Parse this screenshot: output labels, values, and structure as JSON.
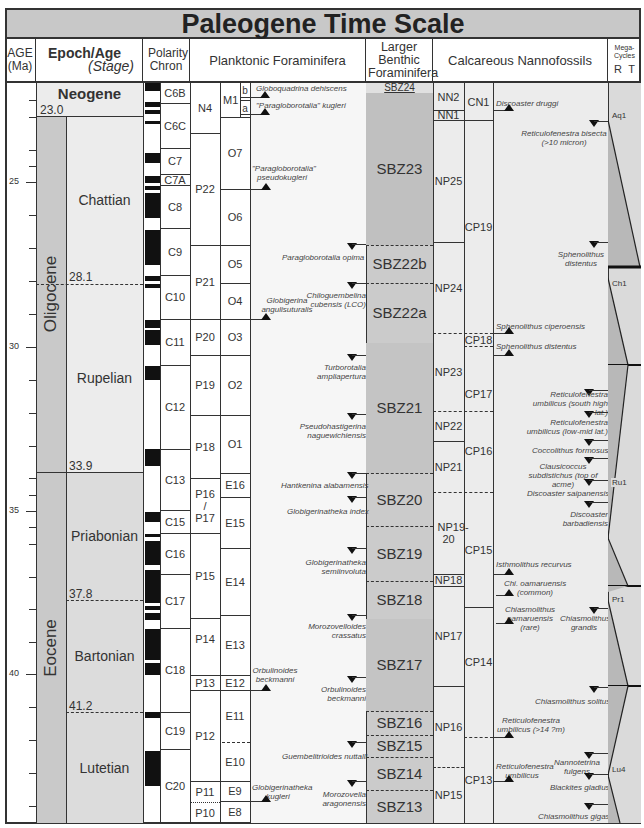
{
  "title": "Paleogene Time Scale",
  "headers": {
    "age": "AGE (Ma)",
    "epoch_age": "Epoch/Age",
    "stage": "(Stage)",
    "polarity": "Polarity Chron",
    "planktonic": "Planktonic Foraminifera",
    "larger_benthic": "Larger Benthic Foraminifera",
    "nannofossils": "Calcareous Nannofossils",
    "megacycles": "Mega-Cycles",
    "mega_R": "R",
    "mega_T": "T"
  },
  "age_scale": {
    "ticks": [
      "25",
      "30",
      "35",
      "40"
    ],
    "px_per_ma": 32.8,
    "boundaries": [
      "23.0",
      "28.1",
      "33.9",
      "37.8",
      "41.2"
    ]
  },
  "epochs": [
    {
      "name": "Neogene"
    },
    {
      "name": "Oligocene"
    },
    {
      "name": "Eocene"
    }
  ],
  "stages": [
    {
      "name": "Chattian"
    },
    {
      "name": "Rupelian"
    },
    {
      "name": "Priabonian"
    },
    {
      "name": "Bartonian"
    },
    {
      "name": "Lutetian"
    }
  ],
  "chrons": [
    "C6B",
    "C6C",
    "C7",
    "C7A",
    "C8",
    "C9",
    "C10",
    "C11",
    "C12",
    "C13",
    "C15",
    "C16",
    "C17",
    "C18",
    "C19",
    "C20"
  ],
  "p_zones": [
    "N4",
    "P22",
    "P21",
    "P20",
    "P19",
    "P18",
    "P16 / P17",
    "P15",
    "P14",
    "P13",
    "P12",
    "P11",
    "P10"
  ],
  "oe_zones": [
    "M1",
    "b",
    "a",
    "O7",
    "O6",
    "O5",
    "O4",
    "O3",
    "O2",
    "O1",
    "E16",
    "E15",
    "E14",
    "E13",
    "E12",
    "E11",
    "E10",
    "E9",
    "E8"
  ],
  "planktonic_events": [
    "Globoquadrina dehiscens",
    "\"Paragloborotalia\" kugleri",
    "\"Paragloborotalia\" pseudokugleri",
    "Paragloborotalia opima",
    "Globigerina angulisuturalis",
    "Chiloguembelina cubensis (LCO)",
    "Turborotalia ampliapertura",
    "Pseudohastigerina naguewichiensis",
    "Hantkenina alabamensis",
    "Globigerinatheka index",
    "Globigerinatheka semiinvoluta",
    "Morozovelloides crassatus",
    "Orbulinoides beckmanni",
    "Orbulinoides beckmanni",
    "Guembelitrioides nuttalli",
    "Globigerinatheka kugleri",
    "Morozovella aragonensis"
  ],
  "sbz_zones": [
    "SBZ24",
    "SBZ23",
    "SBZ22b",
    "SBZ22a",
    "SBZ21",
    "SBZ20",
    "SBZ19",
    "SBZ18",
    "SBZ17",
    "SBZ16",
    "SBZ15",
    "SBZ14",
    "SBZ13"
  ],
  "nn_zones": [
    "NN2",
    "NN1",
    "NP25",
    "NP24",
    "NP23",
    "NP22",
    "NP21",
    "NP19-20",
    "NP18",
    "NP17",
    "NP16",
    "NP15"
  ],
  "cn_zones": [
    "CN1",
    "CP19",
    "CP18",
    "CP17",
    "CP16",
    "CP15",
    "CP14",
    "CP13"
  ],
  "nanno_events": [
    "Discoaster druggi",
    "Reticulofenestra bisecta (>10 micron)",
    "Sphenolithus distentus",
    "Sphenolithus ciperoensis",
    "Sphenolithus distentus",
    "Reticulofenestra umbilicus (south high lat.)",
    "Reticulofenestra umbilicus (low-mid lat.)",
    "Coccolithus formosus",
    "Clausicoccus subdistichus (top of acme)",
    "Discoaster saipanensis",
    "Discoaster barbadiensis",
    "Isthmolithus recurvus",
    "Chi. oamaruensis (common)",
    "Chiasmolithus oamaruensis (rare)",
    "Chiasmolithus grandis",
    "Chiasmolithus solitus",
    "Reticulofenestra umbilicus (>14 ?m)",
    "Reticulofenestra umbilicus",
    "Nannotetrina fulgens",
    "Blackites gladius",
    "Chiasmolithus gigas"
  ],
  "megacycles": [
    "Aq1",
    "Ch1",
    "Ru1",
    "Pr1",
    "Lu4"
  ]
}
